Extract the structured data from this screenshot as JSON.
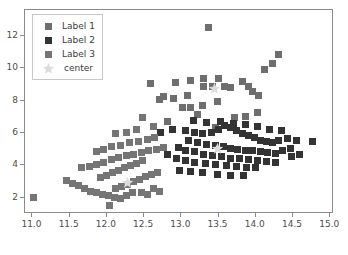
{
  "chart_data": {
    "type": "scatter",
    "title": "",
    "xlabel": "",
    "ylabel": "",
    "xlim": [
      10.9,
      15.05
    ],
    "ylim": [
      1.0,
      13.6
    ],
    "xticks": [
      "11.0",
      "11.5",
      "12.0",
      "12.5",
      "13.0",
      "13.5",
      "14.0",
      "14.5",
      "15.0"
    ],
    "xtick_values": [
      11.0,
      11.5,
      12.0,
      12.5,
      13.0,
      13.5,
      14.0,
      14.5,
      15.0
    ],
    "yticks": [
      "2",
      "4",
      "6",
      "8",
      "10",
      "12"
    ],
    "ytick_values": [
      2,
      4,
      6,
      8,
      10,
      12
    ],
    "grid": false,
    "legend_position": "upper-left",
    "marker": "square",
    "center_marker": "star",
    "colors": {
      "label1": "#6e6e6e",
      "label2": "#333333",
      "label3": "#757575",
      "center": "#dcdcdc",
      "axis": "#8a8a8a",
      "text": "#4d4d4d",
      "background": "#ffffff"
    },
    "legend": [
      {
        "name": "Label 1",
        "marker": "square",
        "color": "#6e6e6e"
      },
      {
        "name": "Label 2",
        "marker": "square",
        "color": "#333333"
      },
      {
        "name": "Label 3",
        "marker": "square",
        "color": "#757575"
      },
      {
        "name": "center",
        "marker": "star",
        "color": "#dcdcdc"
      }
    ],
    "series": [
      {
        "name": "Label 1",
        "color": "#6e6e6e",
        "points": [
          [
            13.36,
            12.55
          ],
          [
            14.3,
            10.85
          ],
          [
            14.22,
            10.3
          ],
          [
            14.12,
            9.95
          ],
          [
            12.76,
            8.25
          ],
          [
            13.02,
            7.6
          ],
          [
            13.12,
            7.6
          ],
          [
            13.28,
            7.7
          ],
          [
            13.22,
            7.15
          ],
          [
            13.48,
            7.95
          ],
          [
            13.82,
            9.2
          ],
          [
            13.9,
            8.85
          ],
          [
            13.96,
            8.55
          ],
          [
            14.04,
            8.3
          ],
          [
            13.58,
            8.9
          ],
          [
            13.66,
            8.8
          ],
          [
            13.42,
            8.9
          ],
          [
            13.3,
            8.85
          ],
          [
            12.92,
            9.1
          ],
          [
            13.12,
            9.25
          ],
          [
            13.3,
            9.35
          ],
          [
            13.5,
            9.4
          ],
          [
            12.58,
            9.05
          ],
          [
            12.82,
            6.7
          ],
          [
            13.72,
            6.95
          ],
          [
            13.86,
            7.05
          ],
          [
            14.02,
            7.25
          ],
          [
            13.46,
            6.35
          ],
          [
            12.7,
            8.05
          ],
          [
            12.9,
            8.15
          ],
          [
            13.08,
            8.35
          ]
        ]
      },
      {
        "name": "Label 2",
        "color": "#333333",
        "points": [
          [
            13.06,
            6.15
          ],
          [
            13.18,
            6.05
          ],
          [
            13.28,
            5.95
          ],
          [
            13.4,
            6.05
          ],
          [
            13.5,
            6.25
          ],
          [
            13.58,
            6.45
          ],
          [
            13.66,
            6.35
          ],
          [
            13.74,
            6.15
          ],
          [
            13.82,
            6.0
          ],
          [
            13.9,
            5.85
          ],
          [
            13.98,
            5.7
          ],
          [
            14.06,
            5.55
          ],
          [
            14.14,
            5.45
          ],
          [
            14.22,
            5.4
          ],
          [
            14.3,
            5.55
          ],
          [
            14.42,
            5.65
          ],
          [
            14.54,
            5.55
          ],
          [
            14.76,
            5.45
          ],
          [
            13.1,
            5.55
          ],
          [
            13.22,
            5.4
          ],
          [
            13.34,
            5.3
          ],
          [
            13.46,
            5.25
          ],
          [
            13.56,
            5.15
          ],
          [
            13.66,
            5.05
          ],
          [
            13.76,
            5.0
          ],
          [
            13.86,
            4.95
          ],
          [
            13.96,
            4.9
          ],
          [
            14.06,
            4.85
          ],
          [
            14.16,
            4.8
          ],
          [
            14.26,
            4.75
          ],
          [
            14.36,
            4.9
          ],
          [
            14.46,
            5.05
          ],
          [
            12.96,
            5.1
          ],
          [
            13.06,
            4.95
          ],
          [
            13.18,
            4.85
          ],
          [
            13.3,
            4.7
          ],
          [
            13.42,
            4.6
          ],
          [
            13.54,
            4.55
          ],
          [
            13.66,
            4.45
          ],
          [
            13.78,
            4.4
          ],
          [
            13.9,
            4.35
          ],
          [
            14.02,
            4.3
          ],
          [
            14.14,
            4.25
          ],
          [
            14.26,
            4.2
          ],
          [
            12.82,
            4.65
          ],
          [
            12.94,
            4.45
          ],
          [
            13.06,
            4.3
          ],
          [
            13.18,
            4.2
          ],
          [
            13.32,
            4.1
          ],
          [
            13.46,
            4.05
          ],
          [
            13.6,
            4.0
          ],
          [
            13.74,
            3.95
          ],
          [
            13.88,
            3.9
          ],
          [
            14.0,
            3.85
          ],
          [
            13.28,
            3.55
          ],
          [
            13.48,
            3.45
          ],
          [
            13.66,
            3.4
          ],
          [
            13.84,
            3.35
          ],
          [
            12.98,
            3.7
          ],
          [
            13.12,
            3.6
          ],
          [
            13.52,
            6.7
          ],
          [
            13.7,
            6.6
          ],
          [
            13.86,
            6.5
          ],
          [
            14.02,
            6.4
          ],
          [
            14.18,
            6.25
          ],
          [
            14.34,
            6.15
          ],
          [
            13.34,
            6.65
          ],
          [
            13.16,
            6.75
          ],
          [
            14.48,
            4.55
          ],
          [
            14.58,
            4.7
          ],
          [
            12.88,
            6.25
          ],
          [
            12.72,
            6.05
          ]
        ]
      },
      {
        "name": "Label 3",
        "color": "#757575",
        "points": [
          [
            11.02,
            2.05
          ],
          [
            11.46,
            3.05
          ],
          [
            11.54,
            2.9
          ],
          [
            11.62,
            2.75
          ],
          [
            11.7,
            2.55
          ],
          [
            11.78,
            2.4
          ],
          [
            11.86,
            2.3
          ],
          [
            11.94,
            2.2
          ],
          [
            12.02,
            2.15
          ],
          [
            12.1,
            2.05
          ],
          [
            12.18,
            1.95
          ],
          [
            12.04,
            1.55
          ],
          [
            12.12,
            2.55
          ],
          [
            12.2,
            2.7
          ],
          [
            12.28,
            2.85
          ],
          [
            12.36,
            3.0
          ],
          [
            12.44,
            3.15
          ],
          [
            12.52,
            3.3
          ],
          [
            12.6,
            3.45
          ],
          [
            12.68,
            3.55
          ],
          [
            11.92,
            3.25
          ],
          [
            12.0,
            3.4
          ],
          [
            12.08,
            3.55
          ],
          [
            12.16,
            3.7
          ],
          [
            12.24,
            3.85
          ],
          [
            12.32,
            4.0
          ],
          [
            12.4,
            4.15
          ],
          [
            12.48,
            4.3
          ],
          [
            11.66,
            3.85
          ],
          [
            11.76,
            3.95
          ],
          [
            11.86,
            4.05
          ],
          [
            11.96,
            4.2
          ],
          [
            12.06,
            4.35
          ],
          [
            12.16,
            4.5
          ],
          [
            12.26,
            4.6
          ],
          [
            12.36,
            4.7
          ],
          [
            12.46,
            4.8
          ],
          [
            12.56,
            4.9
          ],
          [
            12.66,
            5.0
          ],
          [
            12.76,
            5.1
          ],
          [
            12.18,
            5.25
          ],
          [
            12.3,
            5.4
          ],
          [
            12.42,
            5.5
          ],
          [
            12.54,
            5.6
          ],
          [
            12.64,
            5.7
          ],
          [
            12.12,
            5.95
          ],
          [
            12.26,
            6.05
          ],
          [
            12.4,
            6.2
          ],
          [
            12.62,
            6.4
          ],
          [
            12.48,
            6.95
          ],
          [
            11.86,
            4.85
          ],
          [
            11.96,
            5.0
          ],
          [
            12.06,
            5.15
          ],
          [
            12.46,
            2.35
          ],
          [
            12.54,
            2.2
          ],
          [
            12.62,
            2.6
          ],
          [
            12.7,
            2.4
          ],
          [
            12.34,
            2.3
          ],
          [
            12.26,
            2.15
          ]
        ]
      }
    ],
    "centers": [
      {
        "label": "center",
        "x": 13.45,
        "y": 8.85
      },
      {
        "label": "center",
        "x": 13.48,
        "y": 5.15
      },
      {
        "label": "center",
        "x": 12.28,
        "y": 3.05
      }
    ]
  }
}
